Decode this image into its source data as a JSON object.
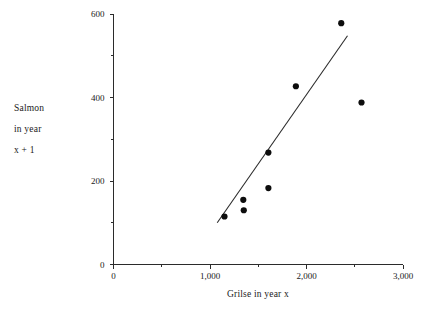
{
  "chart_data": {
    "type": "scatter",
    "title": "",
    "xlabel": "Grilse in year x",
    "ylabel": "Salmon in year x + 1",
    "ylabel_lines": [
      "Salmon",
      "in year",
      "x + 1"
    ],
    "xlim": [
      0,
      3000
    ],
    "ylim": [
      0,
      600
    ],
    "grid": false,
    "legend": null,
    "x_major_ticks": [
      0,
      1000,
      2000,
      3000
    ],
    "x_minor_ticks": [
      500,
      1500,
      2500
    ],
    "x_tick_labels": [
      "0",
      "1,000",
      "2,000",
      "3,000"
    ],
    "y_major_ticks": [
      0,
      200,
      400,
      600
    ],
    "y_minor_ticks": [
      100,
      300,
      500
    ],
    "y_tick_labels": [
      "0",
      "200",
      "400",
      "600"
    ],
    "points": [
      {
        "x": 1150,
        "y": 115
      },
      {
        "x": 1345,
        "y": 155
      },
      {
        "x": 1350,
        "y": 130
      },
      {
        "x": 1605,
        "y": 268
      },
      {
        "x": 1605,
        "y": 183
      },
      {
        "x": 1890,
        "y": 427
      },
      {
        "x": 2360,
        "y": 578
      },
      {
        "x": 2570,
        "y": 388
      }
    ],
    "series": [
      {
        "name": "Salmon vs Grilse",
        "x": [
          1150,
          1345,
          1350,
          1605,
          1605,
          1890,
          2360,
          2570
        ],
        "values": [
          115,
          155,
          130,
          268,
          183,
          427,
          578,
          388
        ]
      }
    ],
    "fit_line": {
      "type": "line",
      "x_start": 1075,
      "y_start": 100,
      "x_end": 2425,
      "y_end": 548
    },
    "colors": {
      "point": "#0d0d0d",
      "line": "#2b2b2b",
      "axis": "#2b2b2b",
      "text": "#1a1a1a",
      "background": "#ffffff"
    }
  }
}
